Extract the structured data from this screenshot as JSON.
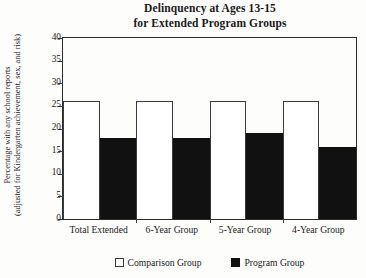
{
  "chart_data": {
    "type": "bar",
    "title": "Delinquency at Ages 13-15 for Extended Program Groups",
    "title_lines": [
      "Delinquency at Ages 13-15",
      "for Extended Program Groups"
    ],
    "xlabel": "",
    "ylabel": "Percentage with any school reports (adjusted for Kindergarten achievement, sex, and risk)",
    "ylabel_lines": [
      "Percentage with any school reports",
      "(adjusted for Kindergarten achievement, sex, and risk)"
    ],
    "categories": [
      "Total Extended",
      "6-Year Group",
      "5-Year Group",
      "4-Year Group"
    ],
    "series": [
      {
        "name": "Comparison Group",
        "color": "#ffffff",
        "values": [
          26,
          26,
          26,
          26
        ]
      },
      {
        "name": "Program Group",
        "color": "#111111",
        "values": [
          18,
          18,
          19,
          16
        ]
      }
    ],
    "ylim": [
      0,
      40
    ],
    "yticks": [
      0,
      5,
      10,
      15,
      20,
      25,
      30,
      35,
      40
    ],
    "ytick_labels": [
      "0",
      "5",
      "10",
      "15",
      "20",
      "25",
      "30",
      "35",
      "40"
    ],
    "grid": false,
    "legend_position": "bottom"
  }
}
